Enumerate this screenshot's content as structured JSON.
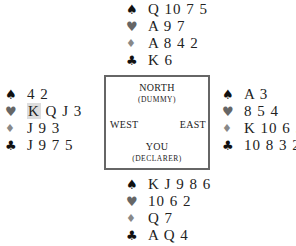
{
  "hands": {
    "north": {
      "spades": "Q 10 7 5",
      "hearts": "A 9 7",
      "diamonds": "A 8 4 2",
      "clubs": "K 6"
    },
    "west": {
      "spades": "4 2",
      "hearts_highlight": "K",
      "hearts_rest": "Q J 3",
      "diamonds": "J 9 3",
      "clubs": "J 9 7 5"
    },
    "east": {
      "spades": "A 3",
      "hearts": "8 5 4",
      "diamonds": "K 10 6 5",
      "clubs": "10 8 3 2"
    },
    "south": {
      "spades": "K J 9 8 6",
      "hearts": "10 6 2",
      "diamonds": "Q 7",
      "clubs": "A Q 4"
    }
  },
  "table": {
    "north": "NORTH",
    "north_sub": "(DUMMY)",
    "west": "WEST",
    "east": "EAST",
    "south": "YOU",
    "south_sub": "(DECLARER)"
  },
  "icons": {
    "spade": "♠",
    "heart": "♥",
    "diamond": "♦",
    "club": "♣"
  }
}
